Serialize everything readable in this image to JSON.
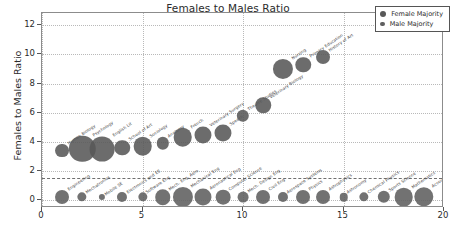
{
  "chart_data": {
    "type": "scatter",
    "title": "Females to Males Ratio",
    "xlabel": "",
    "ylabel": "Females to Males Ratio",
    "xlim": [
      0,
      20
    ],
    "ylim": [
      -0.55,
      12.85
    ],
    "xticks": [
      "0",
      "5",
      "10",
      "15",
      "20"
    ],
    "xtick_values": [
      0,
      5,
      10,
      15,
      20
    ],
    "yticks": [
      "0",
      "2",
      "4",
      "6",
      "8",
      "10",
      "12"
    ],
    "ytick_values": [
      0,
      2,
      4,
      6,
      8,
      10,
      12
    ],
    "grid": true,
    "legend_position": "upper right",
    "reference_line": {
      "y": 1.5,
      "style": "dashed"
    },
    "series": [
      {
        "name": "Female Majority",
        "color": "#585858",
        "points": [
          {
            "label": "Human Biology",
            "x": 1,
            "y": 3.4,
            "size": 9
          },
          {
            "label": "Psychology",
            "x": 2,
            "y": 3.5,
            "size": 17
          },
          {
            "label": "English Lit",
            "x": 3,
            "y": 3.5,
            "size": 16
          },
          {
            "label": "School of Art",
            "x": 4,
            "y": 3.6,
            "size": 10
          },
          {
            "label": "Sociology",
            "x": 5,
            "y": 3.7,
            "size": 12
          },
          {
            "label": "Anatomy",
            "x": 6,
            "y": 3.9,
            "size": 8
          },
          {
            "label": "French",
            "x": 7,
            "y": 4.3,
            "size": 12
          },
          {
            "label": "Veterinary Surgery",
            "x": 8,
            "y": 4.5,
            "size": 11
          },
          {
            "label": "Speech",
            "x": 9,
            "y": 4.6,
            "size": 11
          },
          {
            "label": "Theatre Studies",
            "x": 10,
            "y": 5.8,
            "size": 8
          },
          {
            "label": "Veterinary Biology",
            "x": 11,
            "y": 6.5,
            "size": 10
          },
          {
            "label": "Nursing",
            "x": 12,
            "y": 9.0,
            "size": 13
          },
          {
            "label": "Primary Education",
            "x": 13,
            "y": 9.3,
            "size": 10
          },
          {
            "label": "History of Art",
            "x": 14,
            "y": 9.8,
            "size": 9
          }
        ]
      },
      {
        "name": "Male Majority",
        "color": "#5f5f5f",
        "points": [
          {
            "label": "Engineering",
            "x": 1,
            "y": 0.2,
            "size": 9
          },
          {
            "label": "Mechatronics",
            "x": 2,
            "y": 0.2,
            "size": 6
          },
          {
            "label": "Mobile SE",
            "x": 3,
            "y": 0.2,
            "size": 4
          },
          {
            "label": "Electronics and EE",
            "x": 4,
            "y": 0.2,
            "size": 6.5
          },
          {
            "label": "Software Eng",
            "x": 5,
            "y": 0.2,
            "size": 6
          },
          {
            "label": "Mech. Eng. Aero",
            "x": 6,
            "y": 0.2,
            "size": 10
          },
          {
            "label": "Mechanical Eng",
            "x": 7,
            "y": 0.2,
            "size": 13
          },
          {
            "label": "Aeronautical Eng",
            "x": 8,
            "y": 0.2,
            "size": 11
          },
          {
            "label": "Computer Science",
            "x": 9,
            "y": 0.2,
            "size": 9.5
          },
          {
            "label": "Mech. Design Eng",
            "x": 10,
            "y": 0.2,
            "size": 7
          },
          {
            "label": "Civil Eng",
            "x": 11,
            "y": 0.2,
            "size": 9
          },
          {
            "label": "Aerospace Systems",
            "x": 12,
            "y": 0.2,
            "size": 6.5
          },
          {
            "label": "Physics",
            "x": 13,
            "y": 0.2,
            "size": 9
          },
          {
            "label": "Astrophysics",
            "x": 14,
            "y": 0.2,
            "size": 9
          },
          {
            "label": "Astronomy",
            "x": 15,
            "y": 0.2,
            "size": 5.5
          },
          {
            "label": "Chemical Physics",
            "x": 16,
            "y": 0.2,
            "size": 6
          },
          {
            "label": "Sports Science",
            "x": 17,
            "y": 0.2,
            "size": 8
          },
          {
            "label": "Mathematics",
            "x": 18,
            "y": 0.2,
            "size": 12
          },
          {
            "label": "Accountancy",
            "x": 19,
            "y": 0.2,
            "size": 12.5
          }
        ]
      }
    ],
    "legend": [
      {
        "label": "Female Majority",
        "marker": "large-circle"
      },
      {
        "label": "Male Majority",
        "marker": "small-circle"
      }
    ]
  }
}
